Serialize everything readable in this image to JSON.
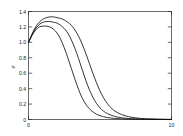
{
  "chart_data": {
    "type": "line",
    "title": "",
    "subtitle": "",
    "xlabel": "",
    "ylabel": "σ",
    "xlim": [
      0,
      10
    ],
    "ylim": [
      0,
      1.4
    ],
    "grid": false,
    "legend": false,
    "legend_position": "none",
    "frame": "box",
    "xticks": [
      0,
      10
    ],
    "xtick_labels": [
      "0",
      "10"
    ],
    "yticks": [
      0,
      0.2,
      0.4,
      0.6,
      0.8,
      1.0,
      1.2,
      1.4
    ],
    "ytick_labels": [
      "0",
      "0.2",
      "0.4",
      "0.6",
      "0.8",
      "1.0",
      "1.2",
      "1.4"
    ],
    "x": [
      0,
      0.25,
      0.5,
      0.75,
      1.0,
      1.25,
      1.5,
      1.75,
      2.0,
      2.25,
      2.5,
      2.75,
      3.0,
      3.25,
      3.5,
      3.75,
      4.0,
      4.25,
      4.5,
      4.75,
      5.0,
      5.25,
      5.5,
      5.75,
      6.0,
      6.25,
      6.5,
      6.75,
      7.0,
      7.25,
      7.5,
      7.75,
      8.0,
      8.5,
      9.0,
      9.5,
      10.0
    ],
    "series": [
      {
        "name": "curve-1",
        "values": [
          1.0,
          1.09,
          1.16,
          1.2,
          1.21,
          1.21,
          1.2,
          1.17,
          1.12,
          1.04,
          0.93,
          0.8,
          0.66,
          0.52,
          0.39,
          0.28,
          0.2,
          0.14,
          0.1,
          0.07,
          0.05,
          0.036,
          0.026,
          0.019,
          0.014,
          0.011,
          0.008,
          0.006,
          0.005,
          0.004,
          0.003,
          0.0025,
          0.002,
          0.0015,
          0.001,
          0.0006,
          0.0003
        ]
      },
      {
        "name": "curve-2",
        "values": [
          1.0,
          1.1,
          1.18,
          1.23,
          1.26,
          1.27,
          1.27,
          1.26,
          1.25,
          1.22,
          1.18,
          1.12,
          1.03,
          0.92,
          0.79,
          0.65,
          0.51,
          0.39,
          0.29,
          0.21,
          0.15,
          0.108,
          0.078,
          0.057,
          0.042,
          0.031,
          0.023,
          0.017,
          0.013,
          0.01,
          0.0078,
          0.006,
          0.0048,
          0.003,
          0.002,
          0.0012,
          0.0006
        ]
      },
      {
        "name": "curve-3",
        "values": [
          1.0,
          1.11,
          1.2,
          1.26,
          1.3,
          1.32,
          1.33,
          1.33,
          1.32,
          1.31,
          1.29,
          1.26,
          1.22,
          1.16,
          1.08,
          0.98,
          0.86,
          0.73,
          0.6,
          0.48,
          0.37,
          0.28,
          0.21,
          0.155,
          0.115,
          0.086,
          0.065,
          0.049,
          0.037,
          0.028,
          0.021,
          0.016,
          0.012,
          0.007,
          0.004,
          0.002,
          0.001
        ]
      }
    ],
    "colors": {
      "curve": "#111111",
      "axis": "#2b2b2b",
      "background": "#ffffff"
    }
  }
}
